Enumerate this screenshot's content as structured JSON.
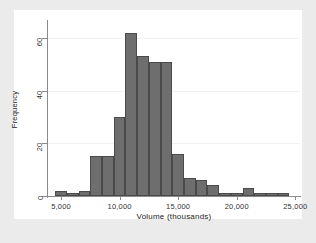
{
  "chart_data": {
    "type": "bar",
    "title": "",
    "subtitle": "",
    "xlabel": "Volume (thousands)",
    "ylabel": "Frequency",
    "xlim": [
      3800,
      25400
    ],
    "ylim": [
      0,
      66
    ],
    "grid": true,
    "legend": null,
    "bin_width": 1000,
    "x_ticks": [
      5000,
      10000,
      15000,
      20000,
      25000
    ],
    "x_tick_labels": [
      "5,000",
      "10,000",
      "15,000",
      "20,000",
      "25,000"
    ],
    "y_ticks": [
      0,
      20,
      40,
      60
    ],
    "y_tick_labels": [
      "0",
      "20",
      "40",
      "60"
    ],
    "bar_color": "#6e6e6e",
    "bar_edge_color": "#4a4a4a",
    "plot_background": "#ffffff",
    "figure_background": "#ebebeb",
    "bins": [
      {
        "left": 4500,
        "right": 5500,
        "value": 2
      },
      {
        "left": 5500,
        "right": 6500,
        "value": 1
      },
      {
        "left": 6500,
        "right": 7500,
        "value": 2
      },
      {
        "left": 7500,
        "right": 8500,
        "value": 15
      },
      {
        "left": 8500,
        "right": 9500,
        "value": 15
      },
      {
        "left": 9500,
        "right": 10500,
        "value": 30
      },
      {
        "left": 10500,
        "right": 11500,
        "value": 62
      },
      {
        "left": 11500,
        "right": 12500,
        "value": 53
      },
      {
        "left": 12500,
        "right": 13500,
        "value": 51
      },
      {
        "left": 13500,
        "right": 14500,
        "value": 51
      },
      {
        "left": 14500,
        "right": 15500,
        "value": 16
      },
      {
        "left": 15500,
        "right": 16500,
        "value": 7
      },
      {
        "left": 16500,
        "right": 17500,
        "value": 6
      },
      {
        "left": 17500,
        "right": 18500,
        "value": 4
      },
      {
        "left": 18500,
        "right": 19500,
        "value": 1
      },
      {
        "left": 19500,
        "right": 20500,
        "value": 1
      },
      {
        "left": 20500,
        "right": 21500,
        "value": 3
      },
      {
        "left": 21500,
        "right": 22500,
        "value": 1
      },
      {
        "left": 22500,
        "right": 23500,
        "value": 1
      },
      {
        "left": 23500,
        "right": 24500,
        "value": 1
      }
    ],
    "categories": [
      "4500-5500",
      "5500-6500",
      "6500-7500",
      "7500-8500",
      "8500-9500",
      "9500-10500",
      "10500-11500",
      "11500-12500",
      "12500-13500",
      "13500-14500",
      "14500-15500",
      "15500-16500",
      "16500-17500",
      "17500-18500",
      "18500-19500",
      "19500-20500",
      "20500-21500",
      "21500-22500",
      "22500-23500",
      "23500-24500"
    ],
    "values": [
      2,
      1,
      2,
      15,
      15,
      30,
      62,
      53,
      51,
      51,
      16,
      7,
      6,
      4,
      1,
      1,
      3,
      1,
      1,
      1
    ]
  }
}
